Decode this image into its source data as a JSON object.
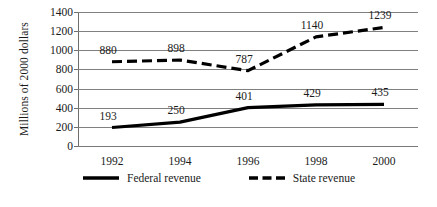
{
  "chart_data": {
    "type": "line",
    "title": "",
    "subtitle": "",
    "xlabel": "",
    "ylabel": "Millions of 2000 dollars",
    "categories": [
      "1992",
      "1994",
      "1996",
      "1998",
      "2000"
    ],
    "x": [
      1992,
      1994,
      1996,
      1998,
      2000
    ],
    "series": [
      {
        "name": "Federal revenue",
        "style": "solid",
        "color": "#000000",
        "values": [
          193,
          250,
          401,
          429,
          435
        ],
        "labels": [
          "193",
          "250",
          "401",
          "429",
          "435"
        ]
      },
      {
        "name": "State revenue",
        "style": "dashed",
        "color": "#000000",
        "values": [
          880,
          898,
          787,
          1140,
          1239
        ],
        "labels": [
          "880",
          "898",
          "787",
          "1140",
          "1239"
        ]
      }
    ],
    "ylim": [
      0,
      1400
    ],
    "ytick_values": [
      0,
      200,
      400,
      600,
      800,
      1000,
      1200,
      1400
    ],
    "ytick_labels": [
      "0",
      "200",
      "400",
      "600",
      "800",
      "1000",
      "1200",
      "1400"
    ],
    "grid": true,
    "grid_axis": "y",
    "legend_position": "bottom",
    "legend_entries": [
      "Federal revenue",
      "State revenue"
    ],
    "annotations": []
  },
  "legend": {
    "federal_label": "Federal revenue",
    "state_label": "State revenue"
  },
  "axes": {
    "y_title": "Millions of 2000 dollars"
  }
}
